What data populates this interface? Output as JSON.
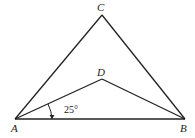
{
  "figure": {
    "points": {
      "A": {
        "label": "A",
        "x": 15,
        "y": 119
      },
      "B": {
        "label": "B",
        "x": 185,
        "y": 119
      },
      "C": {
        "label": "C",
        "x": 102,
        "y": 15
      },
      "D": {
        "label": "D",
        "x": 102,
        "y": 79
      }
    },
    "segments": [
      "AC",
      "CB",
      "AB",
      "AD",
      "DB"
    ],
    "angle_label": "25°",
    "angle_between": [
      "AD",
      "AB"
    ],
    "line_color": "#222222"
  }
}
